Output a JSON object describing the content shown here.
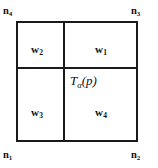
{
  "figure": {
    "background_color": "#ffffff",
    "line_color": "#1a1a1a"
  },
  "cell": {
    "point_label": {
      "symbol": "T",
      "subscript": "α",
      "argument": "(p)",
      "full": "Tα(p)"
    },
    "regions": [
      {
        "id": "w1",
        "name": "upper-right",
        "symbol": "w",
        "subscript": "1"
      },
      {
        "id": "w2",
        "name": "upper-left",
        "symbol": "w",
        "subscript": "2"
      },
      {
        "id": "w3",
        "name": "lower-left",
        "symbol": "w",
        "subscript": "3"
      },
      {
        "id": "w4",
        "name": "lower-right",
        "symbol": "w",
        "subscript": "4"
      }
    ],
    "nodes": [
      {
        "id": "n1",
        "corner": "bottom-left",
        "symbol": "n",
        "subscript": "1"
      },
      {
        "id": "n2",
        "corner": "bottom-right",
        "symbol": "n",
        "subscript": "2"
      },
      {
        "id": "n3",
        "corner": "top-right",
        "symbol": "n",
        "subscript": "3"
      },
      {
        "id": "n4",
        "corner": "top-left",
        "symbol": "n",
        "subscript": "4"
      }
    ]
  }
}
